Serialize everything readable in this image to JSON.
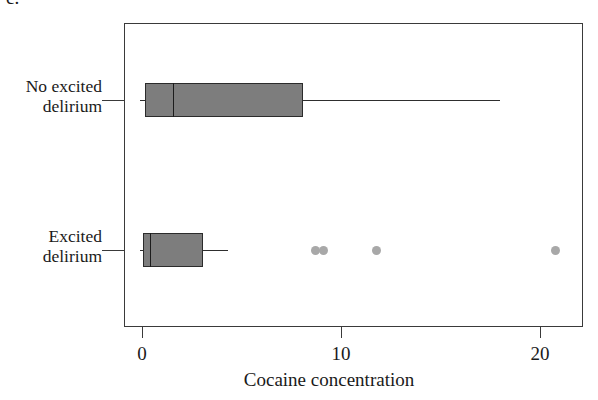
{
  "panel": {
    "letter": "c."
  },
  "chart_data": {
    "type": "box",
    "title": "",
    "xlabel": "Cocaine concentration",
    "ylabel": "",
    "xlim": [
      -0.9,
      22.0
    ],
    "xticks": [
      0,
      10,
      20
    ],
    "xticklabels": [
      "0",
      "10",
      "20"
    ],
    "grid": false,
    "legend": "none",
    "orientation": "horizontal",
    "categories": [
      "No excited delirium",
      "Excited delirium"
    ],
    "boxes": [
      {
        "label": "No excited delirium",
        "label_line1": "No excited",
        "label_line2": "delirium",
        "whisker_low": -0.1,
        "q1": 0.15,
        "median": 1.55,
        "q3": 8.1,
        "whisker_high": 18.0,
        "outliers": []
      },
      {
        "label": "Excited delirium",
        "label_line1": "Excited",
        "label_line2": "delirium",
        "whisker_low": -0.1,
        "q1": 0.05,
        "median": 0.4,
        "q3": 3.05,
        "whisker_high": 4.3,
        "outliers": [
          8.7,
          9.1,
          11.8,
          20.8
        ]
      }
    ]
  },
  "colors": {
    "box_fill": "#7d7d7d",
    "box_edge": "#2b2b2b",
    "outlier": "#a8a8a8",
    "axis": "#3a3a3a",
    "text": "#1a1a1a",
    "background": "#ffffff"
  }
}
